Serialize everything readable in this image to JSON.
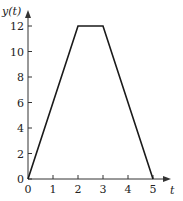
{
  "chart_data": {
    "type": "line",
    "title": "",
    "xlabel": "t",
    "ylabel": "y(t)",
    "x": [
      0,
      2,
      3,
      5
    ],
    "series": [
      {
        "name": "y(t)",
        "values": [
          0,
          12,
          12,
          0
        ]
      }
    ],
    "xlim": [
      0,
      5
    ],
    "ylim": [
      0,
      12
    ],
    "xticks": [
      0,
      1,
      2,
      3,
      4,
      5
    ],
    "yticks": [
      0,
      2,
      4,
      6,
      8,
      10,
      12
    ],
    "grid": false,
    "legend": "none"
  },
  "labels": {
    "xaxis": "t",
    "yaxis": "y(t)",
    "xticks": [
      "0",
      "1",
      "2",
      "3",
      "4",
      "5"
    ],
    "yticks": [
      "0",
      "2",
      "4",
      "6",
      "8",
      "10",
      "12"
    ]
  },
  "colors": {
    "line": "#1a1a1a",
    "axis": "#333333"
  }
}
